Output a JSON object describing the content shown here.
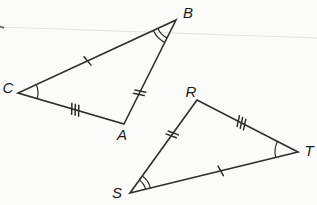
{
  "diagram": {
    "type": "congruent-triangles-figure",
    "canvas": {
      "width": 317,
      "height": 205,
      "background": "#fbfbf9"
    },
    "style": {
      "stroke_color": "#2d2d2d",
      "label_color": "#1c1c1c",
      "line_width": 1.6,
      "tick_width": 1.5,
      "arc_width": 1.2,
      "tick_half_length": 5.5,
      "tick_spacing": 3.6,
      "tick_slant_deg": 15
    },
    "artifacts": {
      "scan_line": {
        "x1": 0,
        "y1": 27,
        "x2": 317,
        "y2": 38,
        "color": "#e2e2dd",
        "width": 1.2
      },
      "edge_mark": {
        "x1": 0,
        "y1": 26.5,
        "x2": 4,
        "y2": 28,
        "color": "#555555",
        "width": 1.5
      }
    },
    "triangles": [
      {
        "id": "ABC",
        "vertices": [
          {
            "name": "A",
            "label": "A",
            "x": 124,
            "y": 124,
            "label_x": 122,
            "label_y": 134
          },
          {
            "name": "B",
            "label": "B",
            "x": 176,
            "y": 20,
            "label_x": 188,
            "label_y": 12
          },
          {
            "name": "C",
            "label": "C",
            "x": 18,
            "y": 93,
            "label_x": 8,
            "label_y": 87
          }
        ],
        "sides": [
          {
            "from": "C",
            "to": "B",
            "tick_marks": 1,
            "tick_pos": 0.44
          },
          {
            "from": "A",
            "to": "B",
            "tick_marks": 2,
            "tick_pos": 0.3
          },
          {
            "from": "C",
            "to": "A",
            "tick_marks": 3,
            "tick_pos": 0.54
          }
        ],
        "angle_marks": [
          {
            "at": "B",
            "between": [
              "C",
              "A"
            ],
            "arcs": 2,
            "radius": 20,
            "arc_gap": 5
          },
          {
            "at": "C",
            "between": [
              "B",
              "A"
            ],
            "arcs": 1,
            "radius": 20,
            "arc_gap": 5
          }
        ]
      },
      {
        "id": "RST",
        "vertices": [
          {
            "name": "R",
            "label": "R",
            "x": 197,
            "y": 100,
            "label_x": 191,
            "label_y": 91
          },
          {
            "name": "S",
            "label": "S",
            "x": 130,
            "y": 193,
            "label_x": 117,
            "label_y": 192
          },
          {
            "name": "T",
            "label": "T",
            "x": 298,
            "y": 152,
            "label_x": 309,
            "label_y": 150
          }
        ],
        "sides": [
          {
            "from": "S",
            "to": "R",
            "tick_marks": 2,
            "tick_pos": 0.63
          },
          {
            "from": "R",
            "to": "T",
            "tick_marks": 3,
            "tick_pos": 0.44
          },
          {
            "from": "S",
            "to": "T",
            "tick_marks": 1,
            "tick_pos": 0.54
          }
        ],
        "angle_marks": [
          {
            "at": "S",
            "between": [
              "R",
              "T"
            ],
            "arcs": 2,
            "radius": 16,
            "arc_gap": 5
          },
          {
            "at": "T",
            "between": [
              "R",
              "S"
            ],
            "arcs": 1,
            "radius": 23,
            "arc_gap": 5
          }
        ]
      }
    ]
  }
}
